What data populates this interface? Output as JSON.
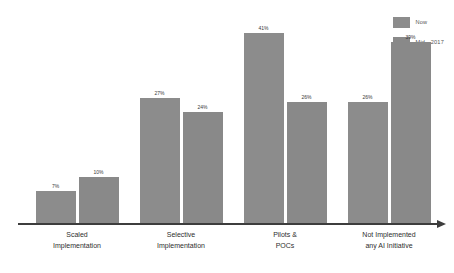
{
  "chart_data": {
    "type": "bar",
    "title": "",
    "subtitle": "",
    "xlabel": "",
    "ylabel": "",
    "grid": false,
    "legend_position": "top-right",
    "ylim": [
      0,
      45
    ],
    "categories": [
      "Scaled Implementation",
      "Selective Implementation",
      "Pilots & POCs",
      "Not Implemented any AI Initiative"
    ],
    "category_lines": [
      [
        "Scaled",
        "Implementation"
      ],
      [
        "Selective",
        "Implementation"
      ],
      [
        "Pilots &",
        "POCs"
      ],
      [
        "Not Implemented",
        "any AI Initiative"
      ]
    ],
    "series": [
      {
        "name": "Now",
        "color": "#8c8c8c",
        "values": [
          7,
          27,
          41,
          26
        ],
        "labels": [
          "7%",
          "27%",
          "41%",
          "26%"
        ]
      },
      {
        "name": "Mid - 2017",
        "color": "#898989",
        "values": [
          10,
          24,
          26,
          39
        ],
        "labels": [
          "10%",
          "24%",
          "26%",
          "39%"
        ]
      }
    ]
  },
  "legend": {
    "items": [
      {
        "label": "Now",
        "color": "#8c8c8c"
      },
      {
        "label": "Mid - 2017",
        "color": "#898989"
      }
    ]
  },
  "axis": {
    "line_color": "#3d3d3d",
    "has_arrow": true
  },
  "colors": {
    "background": "#ffffff",
    "bar_gray": "#8a8a8a",
    "label_text": "#3a3a3a",
    "category_text": "#2e2e2e"
  }
}
